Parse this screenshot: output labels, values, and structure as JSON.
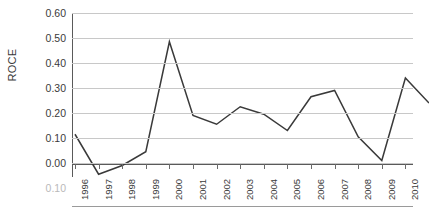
{
  "chart_data": {
    "type": "line",
    "title": "",
    "xlabel": "",
    "ylabel": "ROCE",
    "x": [
      1996,
      1997,
      1998,
      1999,
      2000,
      2001,
      2002,
      2003,
      2004,
      2005,
      2006,
      2007,
      2008,
      2009,
      2010,
      2011
    ],
    "values": [
      0.115,
      -0.045,
      -0.01,
      0.045,
      0.485,
      0.19,
      0.155,
      0.225,
      0.195,
      0.13,
      0.265,
      0.29,
      0.105,
      0.01,
      0.34,
      0.24
    ],
    "series": [
      {
        "name": "ROCE",
        "values": [
          0.115,
          -0.045,
          -0.01,
          0.045,
          0.485,
          0.19,
          0.155,
          0.225,
          0.195,
          0.13,
          0.265,
          0.29,
          0.105,
          0.01,
          0.34,
          0.24
        ]
      }
    ],
    "ylim": [
      -0.1,
      0.6
    ],
    "yticks": [
      0.6,
      0.5,
      0.4,
      0.3,
      0.2,
      0.1,
      0.0,
      -0.1
    ],
    "ytick_labels": [
      "0.60",
      "0.50",
      "0.40",
      "0.30",
      "0.20",
      "0.10",
      "0.00",
      "0.10"
    ],
    "xtick_labels": [
      "1996",
      "1997",
      "1998",
      "1999",
      "2000",
      "2001",
      "2002",
      "2003",
      "2004",
      "2005",
      "2006",
      "2007",
      "2008",
      "2009",
      "2010",
      "2011"
    ],
    "grid": true,
    "grid_axis": "y",
    "legend": false,
    "legend_position": "none",
    "line_color": "#3a3a3a",
    "grid_color": "#c8c8c8",
    "axis_color": "#5a5a5a",
    "background": "#ffffff"
  }
}
